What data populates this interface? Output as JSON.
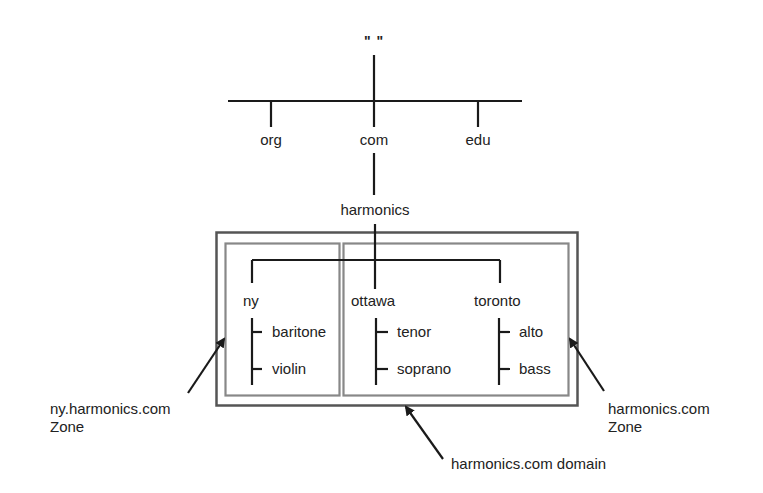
{
  "diagram": {
    "root": {
      "label": "\"    \""
    },
    "tld": [
      {
        "label": "org"
      },
      {
        "label": "com"
      },
      {
        "label": "edu"
      }
    ],
    "second_level": {
      "label": "harmonics"
    },
    "subdomains": [
      {
        "label": "ny",
        "children": [
          "baritone",
          "violin"
        ]
      },
      {
        "label": "ottawa",
        "children": [
          "tenor",
          "soprano"
        ]
      },
      {
        "label": "toronto",
        "children": [
          "alto",
          "bass"
        ]
      }
    ],
    "annotations": {
      "ny_zone": {
        "line1": "ny.harmonics.com",
        "line2": "Zone"
      },
      "harmonics_zone": {
        "line1": "harmonics.com",
        "line2": "Zone"
      },
      "domain": {
        "label": "harmonics.com domain"
      }
    },
    "colors": {
      "line": "#1a1a1a",
      "domain_box": "#555555",
      "zone_box": "#888888"
    }
  }
}
